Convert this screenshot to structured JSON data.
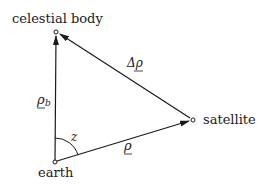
{
  "diagram": {
    "type": "vector-triangle",
    "nodes": {
      "celestial_body": {
        "label": "celestial body",
        "x": 56,
        "y": 32
      },
      "satellite": {
        "label": "satellite",
        "x": 193,
        "y": 120
      },
      "earth": {
        "label": "earth",
        "x": 55,
        "y": 162
      }
    },
    "vectors": {
      "rho_b": {
        "symbol": "ρ",
        "subscript": "b",
        "from": "earth",
        "to": "celestial_body"
      },
      "rho": {
        "symbol": "ρ",
        "from": "earth",
        "to": "satellite"
      },
      "delta_rho": {
        "symbol": "Δρ",
        "from": "satellite",
        "to": "celestial_body"
      }
    },
    "angle": {
      "symbol": "z",
      "vertex": "earth",
      "between": [
        "rho_b",
        "rho"
      ]
    },
    "colors": {
      "ink": "#1a1a1a",
      "background": "#ffffff"
    }
  }
}
